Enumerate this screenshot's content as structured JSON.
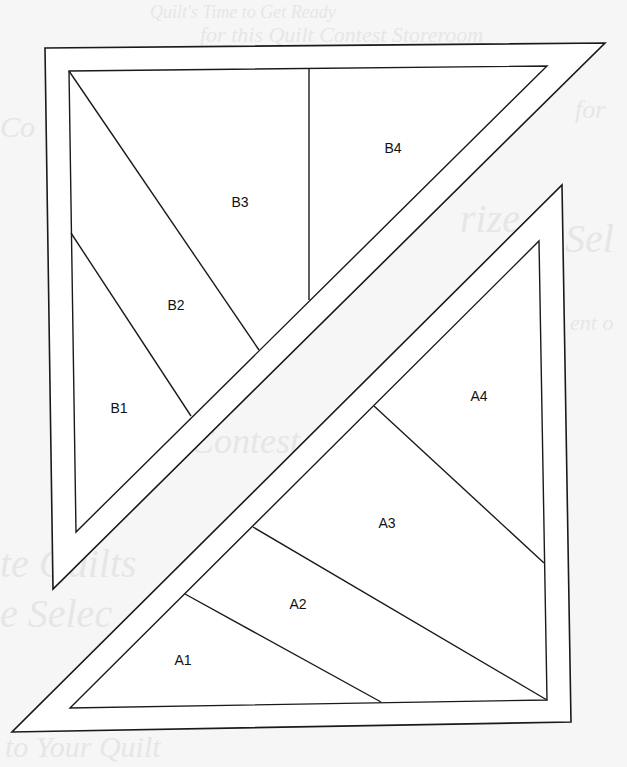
{
  "diagram": {
    "colors": {
      "line": "#1a1a1a",
      "fill": "#ffffff",
      "background": "#f6f6f6",
      "bleed_text": "#e6e6e6"
    },
    "section_b": {
      "name": "B",
      "outer_polygon": [
        [
          45,
          48
        ],
        [
          605,
          43
        ],
        [
          53,
          589
        ]
      ],
      "inner_polygon": [
        [
          69,
          71
        ],
        [
          547,
          66
        ],
        [
          76,
          532
        ]
      ],
      "divider_lines": [
        {
          "id": "B1-B2",
          "from": [
            71,
            233
          ],
          "to": [
            191,
            416
          ]
        },
        {
          "id": "B2-B3",
          "from": [
            69,
            71
          ],
          "to": [
            259,
            350
          ]
        },
        {
          "id": "B3-B4",
          "from": [
            309,
            69
          ],
          "to": [
            309,
            300
          ]
        }
      ],
      "pieces": [
        {
          "label": "B1",
          "x": 119,
          "y": 413
        },
        {
          "label": "B2",
          "x": 176,
          "y": 310
        },
        {
          "label": "B3",
          "x": 240,
          "y": 207
        },
        {
          "label": "B4",
          "x": 393,
          "y": 153
        }
      ]
    },
    "section_a": {
      "name": "A",
      "outer_polygon": [
        [
          562,
          185
        ],
        [
          571,
          722
        ],
        [
          12,
          732
        ]
      ],
      "inner_polygon": [
        [
          539,
          241
        ],
        [
          547,
          700
        ],
        [
          70,
          708
        ]
      ],
      "divider_lines": [
        {
          "id": "A1-A2",
          "from": [
            185,
            594
          ],
          "to": [
            381,
            702
          ]
        },
        {
          "id": "A2-A3",
          "from": [
            253,
            527
          ],
          "to": [
            547,
            700
          ]
        },
        {
          "id": "A3-A4",
          "from": [
            374,
            406
          ],
          "to": [
            544,
            563
          ]
        }
      ],
      "pieces": [
        {
          "label": "A1",
          "x": 183,
          "y": 665
        },
        {
          "label": "A2",
          "x": 298,
          "y": 609
        },
        {
          "label": "A3",
          "x": 387,
          "y": 528
        },
        {
          "label": "A4",
          "x": 479,
          "y": 401
        }
      ]
    }
  },
  "bleed_through": [
    {
      "text": "Quilt's Time to Get Ready",
      "x": 150,
      "y": 2,
      "size": 18
    },
    {
      "text": "for this Quilt Contest Storeroom",
      "x": 200,
      "y": 22,
      "size": 22
    },
    {
      "text": "Co",
      "x": 0,
      "y": 110,
      "size": 30
    },
    {
      "text": "for",
      "x": 575,
      "y": 95,
      "size": 26
    },
    {
      "text": "rize",
      "x": 460,
      "y": 195,
      "size": 40
    },
    {
      "text": "Sel",
      "x": 565,
      "y": 215,
      "size": 40
    },
    {
      "text": "ent o",
      "x": 570,
      "y": 310,
      "size": 22
    },
    {
      "text": "Contest",
      "x": 190,
      "y": 420,
      "size": 36
    },
    {
      "text": "te Quilts",
      "x": 0,
      "y": 540,
      "size": 40
    },
    {
      "text": "e Selec",
      "x": 0,
      "y": 590,
      "size": 40
    },
    {
      "text": "to Your Quilt",
      "x": 5,
      "y": 730,
      "size": 30
    }
  ]
}
